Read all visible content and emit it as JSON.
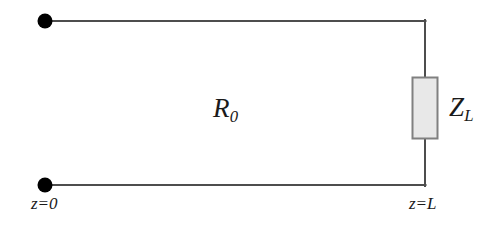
{
  "figure": {
    "background_color": "#ffffff",
    "width": 500,
    "height": 234
  },
  "colors": {
    "wire": "#4d4d4d",
    "terminal_dot": "#000000",
    "box_fill": "#e8e8e8",
    "box_stroke": "#808080",
    "text": "#1a1a1a"
  },
  "labels": {
    "line_impedance": "R",
    "line_impedance_sub": "0",
    "load_impedance": "Z",
    "load_impedance_sub": "L",
    "position_start": "z=0",
    "position_end": "z=L"
  },
  "geometry": {
    "top_wire": {
      "x1": 45,
      "y1": 21,
      "x2": 425,
      "y2": 21
    },
    "bottom_wire": {
      "x1": 45,
      "y1": 185,
      "x2": 425,
      "y2": 185
    },
    "right_wire_upper": {
      "x1": 425,
      "y1": 21,
      "x2": 425,
      "y2": 77
    },
    "right_wire_lower": {
      "x1": 425,
      "y1": 139,
      "x2": 425,
      "y2": 185
    },
    "terminal_top": {
      "cx": 45,
      "cy": 21,
      "r": 7
    },
    "terminal_bottom": {
      "cx": 45,
      "cy": 185,
      "r": 7
    },
    "load_box": {
      "x": 412,
      "y": 77,
      "width": 26,
      "height": 62
    }
  },
  "icons": {
    "terminal_top": "terminal-dot-icon",
    "terminal_bottom": "terminal-dot-icon",
    "load_box": "impedance-box-icon"
  }
}
